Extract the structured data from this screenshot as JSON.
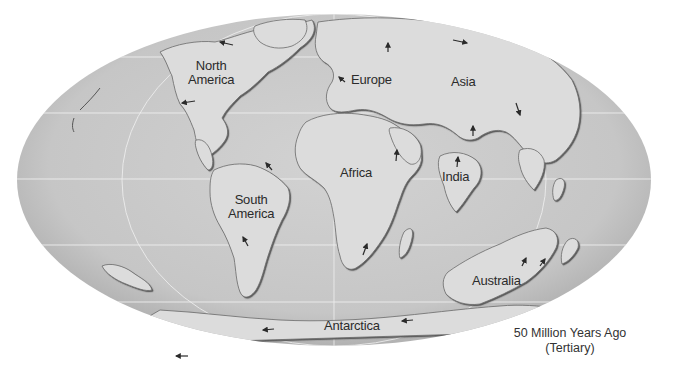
{
  "map": {
    "projection": "mollweide-ellipse",
    "colors": {
      "ocean": "#c8c8c8",
      "ocean_edge": "#a9a9a9",
      "land": "#dcdcdc",
      "coast_shadow": "#5a5a5a",
      "gridline": "#efefef",
      "arrow": "#2a2a2a",
      "label": "#2b2b2b",
      "background": "#ffffff"
    },
    "continents": [
      {
        "id": "north-america",
        "label": "North America",
        "lines": [
          "North",
          "America"
        ]
      },
      {
        "id": "europe",
        "label": "Europe",
        "lines": [
          "Europe"
        ]
      },
      {
        "id": "asia",
        "label": "Asia",
        "lines": [
          "Asia"
        ]
      },
      {
        "id": "africa",
        "label": "Africa",
        "lines": [
          "Africa"
        ]
      },
      {
        "id": "india",
        "label": "India",
        "lines": [
          "India"
        ]
      },
      {
        "id": "south-america",
        "label": "South America",
        "lines": [
          "South",
          "America"
        ]
      },
      {
        "id": "australia",
        "label": "Australia",
        "lines": [
          "Australia"
        ]
      },
      {
        "id": "antarctica",
        "label": "Antarctica",
        "lines": [
          "Antarctica"
        ]
      }
    ],
    "motion_arrows": [
      {
        "near": "north-america",
        "direction": "west"
      },
      {
        "near": "north-america",
        "direction": "west"
      },
      {
        "near": "europe",
        "direction": "northwest"
      },
      {
        "near": "europe",
        "direction": "north"
      },
      {
        "near": "asia",
        "direction": "east"
      },
      {
        "near": "asia",
        "direction": "north"
      },
      {
        "near": "asia",
        "direction": "southeast"
      },
      {
        "near": "africa",
        "direction": "north"
      },
      {
        "near": "africa",
        "direction": "northeast"
      },
      {
        "near": "india",
        "direction": "north"
      },
      {
        "near": "south-america",
        "direction": "northwest"
      },
      {
        "near": "south-america",
        "direction": "northwest"
      },
      {
        "near": "australia",
        "direction": "northeast"
      },
      {
        "near": "australia",
        "direction": "northeast"
      },
      {
        "near": "antarctica",
        "direction": "west"
      },
      {
        "near": "antarctica",
        "direction": "west"
      }
    ]
  },
  "caption": {
    "line1": "50 Million Years Ago",
    "line2": "(Tertiary)"
  }
}
